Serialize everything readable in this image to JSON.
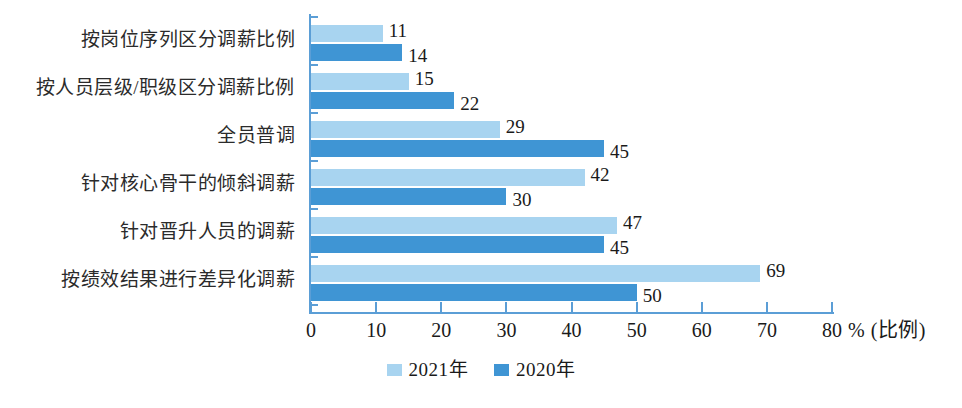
{
  "chart_data": {
    "type": "bar",
    "orientation": "horizontal",
    "title": "",
    "xlabel": "% (比例)",
    "ylabel": "",
    "xlim": [
      0,
      80
    ],
    "xticks": [
      "0",
      "10",
      "20",
      "30",
      "40",
      "50",
      "60",
      "70",
      "80"
    ],
    "grid": false,
    "legend_position": "bottom-center",
    "categories": [
      "按岗位序列区分调薪比例",
      "按人员层级/职级区分调薪比例",
      "全员普调",
      "针对核心骨干的倾斜调薪",
      "针对晋升人员的调薪",
      "按绩效结果进行差异化调薪"
    ],
    "series": [
      {
        "name": "2021年",
        "color": "#a8d4f0",
        "values": [
          11,
          15,
          29,
          42,
          47,
          69
        ]
      },
      {
        "name": "2020年",
        "color": "#3f95d4",
        "values": [
          14,
          22,
          45,
          30,
          45,
          50
        ]
      }
    ]
  },
  "axis": {
    "unit_suffix": "% (比例)",
    "axis_color": "#5b9ed6"
  },
  "legend": {
    "items": [
      {
        "label": "2021年",
        "color": "#a8d4f0"
      },
      {
        "label": "2020年",
        "color": "#3f95d4"
      }
    ]
  }
}
